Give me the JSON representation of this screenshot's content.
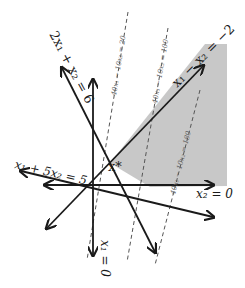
{
  "diagram": {
    "type": "linear-program-feasible-region",
    "colors": {
      "constraint_line": "#1a1a1a",
      "objective_line": "#555555",
      "feasible_region": "#c8c8c8",
      "background": "#ffffff"
    },
    "constraints": [
      {
        "id": "c1",
        "label": "2x₁ + x₂ = 6"
      },
      {
        "id": "c2",
        "label": "x₁ − x₂ = −2"
      },
      {
        "id": "c3",
        "label": "x₁ + 5x₂ = 5"
      },
      {
        "id": "c4",
        "label": "x₂ = 0"
      },
      {
        "id": "c5",
        "label": "x₁ = 0"
      }
    ],
    "objective_contours": [
      {
        "id": "o1",
        "label": "40x₁ − 10x₂ = 20"
      },
      {
        "id": "o2",
        "label": "40x₁ − 10x₂ = 100"
      },
      {
        "id": "o3",
        "label": "40x₁ − 10x₂ = 180"
      }
    ],
    "optimal_point": {
      "label": "x*"
    },
    "feasible_region": {
      "label": "feasible region (shaded)"
    }
  }
}
